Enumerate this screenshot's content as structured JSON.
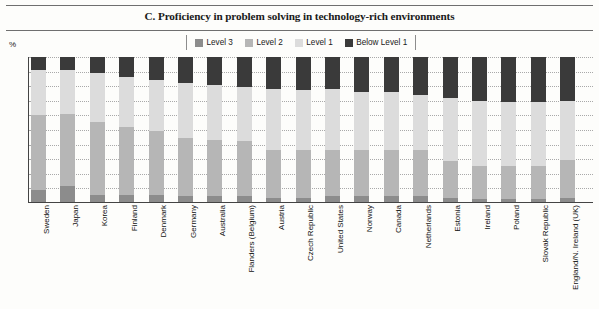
{
  "title": "C. Proficiency in problem solving in technology-rich environments",
  "axis": {
    "unit": "%",
    "ticks": [
      "100",
      "90",
      "80",
      "70",
      "60",
      "50",
      "40",
      "30",
      "20",
      "10",
      "0"
    ]
  },
  "legend": {
    "items": [
      {
        "label": "Level 3",
        "color": "#8c8c8c"
      },
      {
        "label": "Level 2",
        "color": "#b6b6b6"
      },
      {
        "label": "Level 1",
        "color": "#dcdcdc"
      },
      {
        "label": "Below Level 1",
        "color": "#3a3a3a"
      }
    ]
  },
  "colors": {
    "level3": "#8c8c8c",
    "level2": "#b6b6b6",
    "level1": "#dcdcdc",
    "below1": "#3a3a3a",
    "axis": "#444444",
    "grid": "#a9a9a9"
  },
  "chart_data": {
    "type": "bar",
    "stacked": true,
    "title": "C. Proficiency in problem solving in technology-rich environments",
    "xlabel": "",
    "ylabel": "%",
    "ylim": [
      0,
      100
    ],
    "grid": true,
    "legend_position": "top",
    "categories": [
      "Sweden",
      "Japan",
      "Korea",
      "Finland",
      "Denmark",
      "Germany",
      "Australia",
      "Flanders (Belgium)",
      "Austria",
      "Czech Republic",
      "United States",
      "Norway",
      "Canada",
      "Netherlands",
      "Estonia",
      "Ireland",
      "Poland",
      "Slovak Republic",
      "England/N. Ireland (UK)"
    ],
    "series": [
      {
        "name": "Level 3",
        "values": [
          8,
          11,
          5,
          5,
          5,
          4,
          4,
          4,
          3,
          3,
          4,
          4,
          4,
          4,
          3,
          2,
          2,
          2,
          3
        ]
      },
      {
        "name": "Level 2",
        "values": [
          52,
          50,
          50,
          47,
          44,
          40,
          39,
          38,
          33,
          33,
          32,
          32,
          32,
          32,
          25,
          23,
          23,
          23,
          26
        ]
      },
      {
        "name": "Level 1",
        "values": [
          31,
          30,
          34,
          34,
          35,
          38,
          38,
          37,
          42,
          41,
          42,
          40,
          40,
          38,
          44,
          45,
          44,
          44,
          41
        ]
      },
      {
        "name": "Below Level 1",
        "values": [
          9,
          9,
          11,
          14,
          16,
          18,
          19,
          21,
          22,
          23,
          22,
          24,
          24,
          26,
          28,
          30,
          31,
          31,
          30
        ]
      }
    ]
  }
}
